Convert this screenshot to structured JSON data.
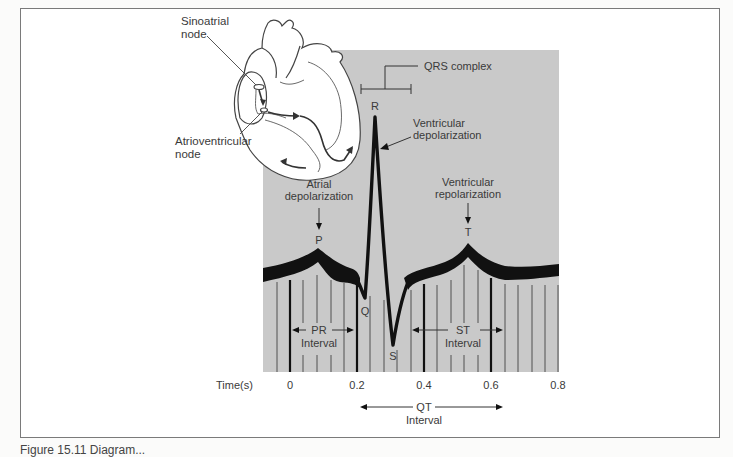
{
  "diagram": {
    "heart_labels": {
      "sa_node_line1": "Sinoatrial",
      "sa_node_line2": "node",
      "av_node_line1": "Atrioventricular",
      "av_node_line2": "node"
    },
    "wave_labels": {
      "p": "P",
      "q": "Q",
      "r": "R",
      "s": "S",
      "t": "T"
    },
    "annotations": {
      "qrs_complex": "QRS complex",
      "ventricular_depolarization_line1": "Ventricular",
      "ventricular_depolarization_line2": "depolarization",
      "atrial_depolarization_line1": "Atrial",
      "atrial_depolarization_line2": "depolarization",
      "ventricular_repolarization_line1": "Ventricular",
      "ventricular_repolarization_line2": "repolarization"
    },
    "intervals": {
      "pr_line1": "PR",
      "pr_line2": "Interval",
      "st_line1": "ST",
      "st_line2": "Interval",
      "qt_line1": "QT",
      "qt_line2": "Interval"
    },
    "time_axis": {
      "label": "Time(s)",
      "ticks": [
        "0",
        "0.2",
        "0.4",
        "0.6",
        "0.8"
      ]
    },
    "colors": {
      "panel": "#c8c8c8",
      "trace": "#111111",
      "grid_thin": "#4a4a4a",
      "grid_thick": "#111111",
      "text": "#3a3a3a"
    }
  },
  "caption": "Figure 15.11 Diagram..."
}
